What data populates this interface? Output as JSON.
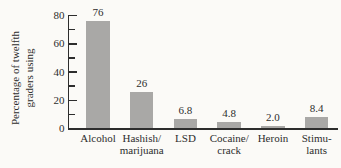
{
  "figure": {
    "background": "#fbfaf7",
    "bar_color": "#a9a8a6",
    "axis_color": "#2d2d2d",
    "text_color": "#2d2d2d"
  },
  "chart_data": {
    "type": "bar",
    "ylabel": "Percentage of twelfth\ngraders using",
    "ylim": [
      0,
      80
    ],
    "y_major_ticks": [
      0,
      20,
      40,
      60,
      80
    ],
    "y_minor_ticks": [
      10,
      30,
      50,
      70
    ],
    "categories": [
      "Alcohol",
      "Hashish/\nmarijuana",
      "LSD",
      "Cocaine/\ncrack",
      "Heroin",
      "Stimu-\nlants"
    ],
    "values": [
      76,
      26,
      6.8,
      4.8,
      2.0,
      8.4
    ],
    "value_labels": [
      "76",
      "26",
      "6.8",
      "4.8",
      "2.0",
      "8.4"
    ],
    "grid": false,
    "legend": "none"
  }
}
